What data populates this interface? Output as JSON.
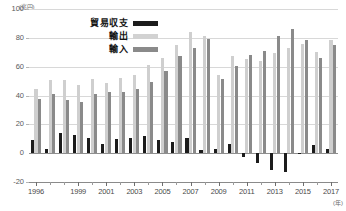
{
  "chart_data": {
    "type": "bar",
    "title": "",
    "xlabel": "年",
    "ylabel": "兆円",
    "y_unit_label": "(兆円)",
    "x_unit_label": "(年)",
    "ylim": [
      -20,
      100
    ],
    "yticks": [
      100,
      80,
      60,
      40,
      20,
      0,
      -20
    ],
    "ytick_labels": [
      "100",
      "80",
      "60",
      "40",
      "20",
      "0",
      "-20"
    ],
    "grid": true,
    "legend_position": "top-left",
    "categories": [
      "1996",
      "1997",
      "1998",
      "1999",
      "2000",
      "2001",
      "2002",
      "2003",
      "2004",
      "2005",
      "2006",
      "2007",
      "2008",
      "2009",
      "2010",
      "2011",
      "2012",
      "2013",
      "2014",
      "2015",
      "2016",
      "2017"
    ],
    "xtick_labels": [
      "1996",
      "1999",
      "2001",
      "2003",
      "2005",
      "2007",
      "2009",
      "2011",
      "2013",
      "2015",
      "2017"
    ],
    "series": [
      {
        "name": "貿易収支",
        "color": "#1c1c1c",
        "values": [
          9.0,
          2.9,
          13.9,
          12.3,
          10.7,
          6.6,
          9.9,
          10.2,
          12.0,
          8.8,
          8.0,
          10.8,
          2.1,
          2.6,
          6.6,
          -2.6,
          -6.9,
          -11.5,
          -12.8,
          -0.6,
          5.8,
          3.0
        ]
      },
      {
        "name": "輸出",
        "color": "#cfcfcf",
        "values": [
          44.7,
          50.9,
          50.6,
          47.5,
          51.7,
          48.9,
          52.1,
          54.5,
          61.2,
          65.7,
          75.2,
          83.9,
          81.0,
          54.2,
          67.4,
          65.5,
          63.7,
          69.8,
          73.1,
          75.6,
          70.0,
          78.3
        ]
      },
      {
        "name": "輸入",
        "color": "#8a8a8a",
        "values": [
          37.9,
          40.9,
          36.6,
          35.3,
          40.9,
          42.4,
          42.2,
          44.4,
          49.2,
          56.9,
          67.3,
          73.1,
          78.9,
          51.5,
          60.8,
          68.1,
          70.7,
          81.2,
          85.9,
          78.4,
          66.0,
          75.3
        ]
      }
    ]
  },
  "legend": {
    "items": [
      {
        "label": "貿易収支",
        "swatch": "sw-balance"
      },
      {
        "label": "輸出",
        "swatch": "sw-exports"
      },
      {
        "label": "輸入",
        "swatch": "sw-imports"
      }
    ]
  }
}
